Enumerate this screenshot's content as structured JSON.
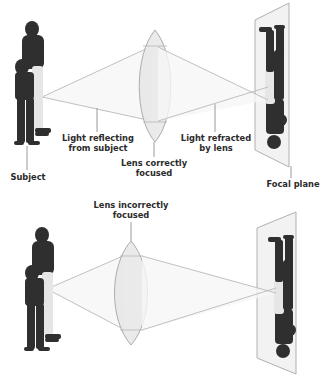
{
  "diagram": {
    "colors": {
      "ray": "#b9b9b9",
      "lens_fill": "#e9e9e9",
      "lens_stroke": "#a9a9a9",
      "plane_fill": "#f2f2f2",
      "plane_stroke": "#b0b0b0",
      "figure_dark": "#2f2f2f",
      "figure_light": "#e6e6e6",
      "label_text": "#2b2b2b",
      "leader": "#9a9a9a"
    },
    "panels": [
      {
        "id": "correct",
        "labels": {
          "subject": "Subject",
          "light_reflecting_line1": "Light reflecting",
          "light_reflecting_line2": "from subject",
          "lens_line1": "Lens correctly",
          "lens_line2": "focused",
          "light_refracted_line1": "Light refracted",
          "light_refracted_line2": "by lens",
          "focal_plane": "Focal plane"
        }
      },
      {
        "id": "incorrect",
        "labels": {
          "lens_line1": "Lens incorrectly",
          "lens_line2": "focused"
        }
      }
    ]
  }
}
